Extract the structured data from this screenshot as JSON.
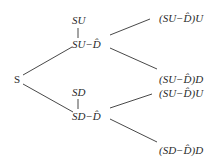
{
  "diagram": {
    "type": "binomial-tree",
    "nodes": {
      "root": "S",
      "up": "SU",
      "up_adj": "SU−D̂",
      "down": "SD",
      "down_adj": "SD−D̂",
      "uu": "(SU−D̂)U",
      "ud": "(SU−D̂)D",
      "du": "(SU−D̂)U",
      "dd": "(SD−D̂)D"
    },
    "line_color": "#333333",
    "text_color": "#2a2a2a"
  }
}
